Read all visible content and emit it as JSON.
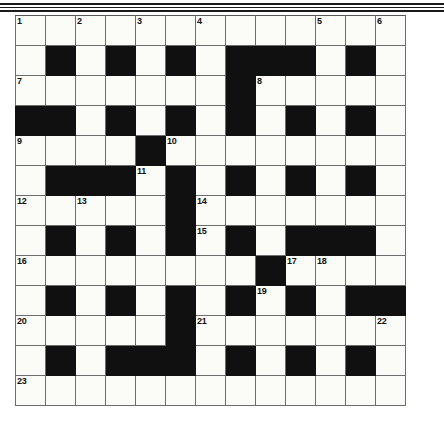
{
  "page": {
    "background_color": "#ffffff",
    "grid_line_color": "#6d6d6d",
    "block_color": "#101010",
    "cell_color": "#fbfbf8"
  },
  "decorations": {
    "top_rules": 3,
    "rule_color": "#1b1b1b"
  },
  "crossword": {
    "columns": 13,
    "rows": 13,
    "cell_size_px": 30,
    "numbers_present": [
      1,
      2,
      3,
      4,
      5,
      6,
      7,
      8,
      9,
      10,
      11,
      12,
      13,
      14,
      15,
      16,
      17,
      18,
      19,
      20,
      21,
      22,
      23
    ],
    "legend": {
      "0": "white-cell",
      "1": "black-cell"
    },
    "blocks": [
      [
        0,
        0,
        0,
        0,
        0,
        0,
        0,
        0,
        0,
        0,
        0,
        0,
        0
      ],
      [
        0,
        1,
        0,
        1,
        0,
        1,
        0,
        1,
        1,
        1,
        0,
        1,
        0
      ],
      [
        0,
        0,
        0,
        0,
        0,
        0,
        0,
        1,
        0,
        0,
        0,
        0,
        0
      ],
      [
        1,
        1,
        0,
        1,
        0,
        1,
        0,
        1,
        0,
        1,
        0,
        1,
        0
      ],
      [
        0,
        0,
        0,
        0,
        1,
        0,
        0,
        0,
        0,
        0,
        0,
        0,
        0
      ],
      [
        0,
        1,
        1,
        1,
        0,
        1,
        0,
        1,
        0,
        1,
        0,
        1,
        0
      ],
      [
        0,
        0,
        0,
        0,
        0,
        1,
        0,
        0,
        0,
        0,
        0,
        0,
        0
      ],
      [
        0,
        1,
        0,
        1,
        0,
        1,
        0,
        1,
        0,
        1,
        1,
        1,
        0
      ],
      [
        0,
        0,
        0,
        0,
        0,
        0,
        0,
        0,
        1,
        0,
        0,
        0,
        0
      ],
      [
        0,
        1,
        0,
        1,
        0,
        1,
        0,
        1,
        0,
        1,
        0,
        1,
        1
      ],
      [
        0,
        0,
        0,
        0,
        0,
        1,
        0,
        0,
        0,
        0,
        0,
        0,
        0
      ],
      [
        0,
        1,
        0,
        1,
        1,
        1,
        0,
        1,
        0,
        1,
        0,
        1,
        0
      ],
      [
        0,
        0,
        0,
        0,
        0,
        0,
        0,
        0,
        0,
        0,
        0,
        0,
        0
      ]
    ],
    "numbering": [
      [
        1,
        0,
        2,
        0,
        3,
        0,
        4,
        0,
        0,
        0,
        5,
        0,
        6
      ],
      [
        0,
        0,
        0,
        0,
        0,
        0,
        0,
        0,
        0,
        0,
        0,
        0,
        0
      ],
      [
        7,
        0,
        0,
        0,
        0,
        0,
        0,
        0,
        8,
        0,
        0,
        0,
        0
      ],
      [
        0,
        0,
        0,
        0,
        0,
        0,
        0,
        0,
        0,
        0,
        0,
        0,
        0
      ],
      [
        9,
        0,
        0,
        0,
        0,
        10,
        0,
        0,
        0,
        0,
        0,
        0,
        0
      ],
      [
        0,
        0,
        0,
        0,
        11,
        0,
        0,
        0,
        0,
        0,
        0,
        0,
        0
      ],
      [
        12,
        0,
        13,
        0,
        0,
        0,
        14,
        0,
        0,
        0,
        0,
        0,
        0
      ],
      [
        0,
        0,
        0,
        0,
        0,
        0,
        15,
        0,
        0,
        0,
        0,
        0,
        0
      ],
      [
        16,
        0,
        0,
        0,
        0,
        0,
        0,
        0,
        0,
        17,
        18,
        0,
        0
      ],
      [
        0,
        0,
        0,
        0,
        0,
        0,
        0,
        0,
        19,
        0,
        0,
        0,
        0
      ],
      [
        20,
        0,
        0,
        0,
        0,
        0,
        21,
        0,
        0,
        0,
        0,
        0,
        22
      ],
      [
        0,
        0,
        0,
        0,
        0,
        0,
        0,
        0,
        0,
        0,
        0,
        0,
        0
      ],
      [
        23,
        0,
        0,
        0,
        0,
        0,
        0,
        0,
        0,
        0,
        0,
        0,
        0
      ]
    ]
  }
}
